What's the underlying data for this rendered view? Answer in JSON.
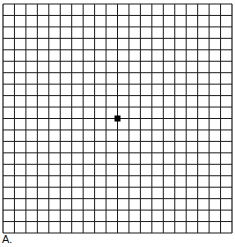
{
  "figure": {
    "label": "A.",
    "grid": {
      "rows": 20,
      "cols": 20,
      "left": 3,
      "top": 4,
      "size": 229,
      "line_color": "#1a1a1a",
      "line_width": 1,
      "border_width": 1.2
    },
    "center_dot": {
      "color": "#000000",
      "size": 6
    }
  }
}
